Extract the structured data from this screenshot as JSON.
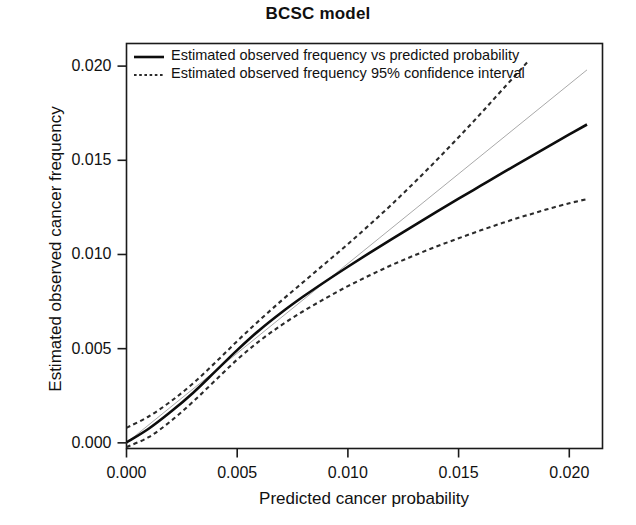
{
  "chart_data": {
    "type": "line",
    "title": "BCSC model",
    "xlabel": "Predicted cancer probability",
    "ylabel": "Estimated observed cancer frequency",
    "xlim": [
      0.0,
      0.0215
    ],
    "ylim": [
      -0.0003,
      0.0212
    ],
    "grid": false,
    "legend_position": "top-left",
    "xticks": [
      "0.000",
      "0.005",
      "0.010",
      "0.015",
      "0.020"
    ],
    "xtick_values": [
      0.0,
      0.005,
      0.01,
      0.015,
      0.02
    ],
    "yticks": [
      "0.000",
      "0.005",
      "0.010",
      "0.015",
      "0.020"
    ],
    "ytick_values": [
      0.0,
      0.005,
      0.01,
      0.015,
      0.02
    ],
    "series": [
      {
        "name": "Estimated observed frequency vs predicted probability",
        "style": "solid",
        "color": "#0d0d0d",
        "width": 2.6,
        "x": [
          0.0,
          0.001,
          0.002,
          0.003,
          0.004,
          0.005,
          0.006,
          0.007,
          0.008,
          0.009,
          0.01,
          0.011,
          0.012,
          0.013,
          0.014,
          0.015,
          0.016,
          0.017,
          0.018,
          0.019,
          0.02,
          0.0208
        ],
        "y": [
          2e-05,
          0.00075,
          0.00165,
          0.00265,
          0.00378,
          0.00492,
          0.00598,
          0.00692,
          0.00778,
          0.00858,
          0.00935,
          0.0101,
          0.01083,
          0.01155,
          0.01226,
          0.01296,
          0.01365,
          0.01434,
          0.01502,
          0.0157,
          0.01637,
          0.0169
        ]
      },
      {
        "name": "Estimated observed frequency 95% confidence interval upper",
        "style": "dashed",
        "color": "#2b2b2b",
        "width": 2.1,
        "x": [
          0.0,
          0.001,
          0.002,
          0.003,
          0.004,
          0.005,
          0.006,
          0.007,
          0.008,
          0.009,
          0.01,
          0.011,
          0.012,
          0.013,
          0.014,
          0.015,
          0.016,
          0.017,
          0.0181
        ],
        "y": [
          0.0008,
          0.0014,
          0.0022,
          0.00315,
          0.00425,
          0.0054,
          0.0065,
          0.00755,
          0.00855,
          0.00955,
          0.01055,
          0.0116,
          0.01268,
          0.01382,
          0.015,
          0.01622,
          0.01748,
          0.01878,
          0.0202
        ]
      },
      {
        "name": "Estimated observed frequency 95% confidence interval lower",
        "style": "dashed",
        "color": "#2b2b2b",
        "width": 2.1,
        "x": [
          0.0,
          0.001,
          0.002,
          0.003,
          0.004,
          0.005,
          0.006,
          0.007,
          0.008,
          0.009,
          0.01,
          0.011,
          0.012,
          0.013,
          0.014,
          0.015,
          0.016,
          0.017,
          0.018,
          0.019,
          0.02,
          0.0208
        ],
        "y": [
          -0.00022,
          0.0003,
          0.00115,
          0.00218,
          0.0033,
          0.00442,
          0.0054,
          0.00625,
          0.007,
          0.00768,
          0.00832,
          0.0089,
          0.00945,
          0.00995,
          0.01042,
          0.01086,
          0.01128,
          0.01168,
          0.01205,
          0.0124,
          0.01272,
          0.01294
        ]
      },
      {
        "name": "reference identity line",
        "style": "solid-thin",
        "color": "#a9a9a9",
        "width": 1.0,
        "x": [
          0.0,
          0.0208
        ],
        "y": [
          0.0,
          0.0198
        ]
      }
    ]
  },
  "legend": {
    "entries": [
      {
        "label": "Estimated observed frequency vs predicted probability",
        "style": "solid"
      },
      {
        "label": "Estimated observed frequency 95% confidence interval",
        "style": "dotted"
      }
    ]
  }
}
